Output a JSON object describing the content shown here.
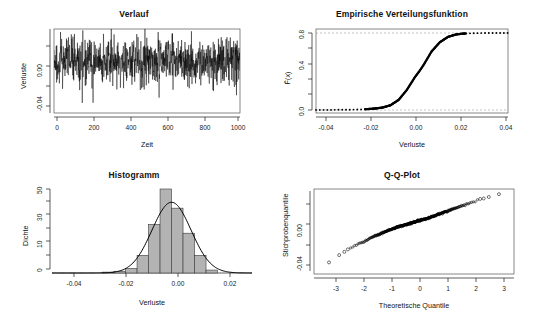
{
  "figure": {
    "background": "#ffffff",
    "layout": "2x2 panel grid",
    "width": 537,
    "height": 322
  },
  "panels": [
    {
      "id": "verlauf",
      "title": "Verlauf",
      "xlabel": "Zeit",
      "ylabel": "Verluste",
      "xticks": [
        "0",
        "200",
        "400",
        "600",
        "800",
        "1000"
      ],
      "yticks": [
        "-0.04",
        "0.00"
      ]
    },
    {
      "id": "ecdf",
      "title": "Empirische Verteilungsfunktion",
      "xlabel": "Verluste",
      "ylabel": "F(x)",
      "xticks": [
        "-0.04",
        "-0.02",
        "0.00",
        "0.02",
        "0.04"
      ],
      "yticks": [
        "0.0",
        "0.4",
        "0.8"
      ]
    },
    {
      "id": "histogram",
      "title": "Histogramm",
      "xlabel": "Verluste",
      "ylabel": "Dichte",
      "xticks": [
        "-0.04",
        "-0.02",
        "0.00",
        "0.02"
      ],
      "yticks": [
        "0",
        "10",
        "30",
        "50"
      ]
    },
    {
      "id": "qq",
      "title": "Q-Q-Plot",
      "xlabel": "Theoretische Quantile",
      "ylabel": "Stichprobenquantile",
      "xticks": [
        "-3",
        "-2",
        "-1",
        "0",
        "1",
        "2",
        "3"
      ],
      "yticks": [
        "-0.04",
        "0.00"
      ]
    }
  ],
  "chart_data": [
    {
      "type": "line",
      "id": "verlauf",
      "title": "Verlauf",
      "xlabel": "Zeit",
      "ylabel": "Verluste",
      "xlim": [
        0,
        1000
      ],
      "ylim": [
        -0.05,
        0.032
      ],
      "xticks": [
        0,
        200,
        400,
        600,
        800,
        1000
      ],
      "yticks": [
        -0.04,
        0.0
      ],
      "grid": false,
      "description": "Time series of 1000 simulated loss returns fluctuating around zero with volatility clustering; several large negative spikes near t=210 and t=565 and positive spikes near t=445 and t=560.",
      "series": [
        {
          "name": "Verluste",
          "n_points": 1000,
          "mean": 0.0,
          "sd": 0.0088,
          "min": -0.046,
          "max": 0.03,
          "notable_spikes": [
            {
              "x": 210,
              "y": -0.04
            },
            {
              "x": 445,
              "y": 0.027
            },
            {
              "x": 560,
              "y": 0.029
            },
            {
              "x": 565,
              "y": -0.035
            },
            {
              "x": 930,
              "y": 0.024
            }
          ]
        }
      ]
    },
    {
      "type": "line",
      "id": "ecdf",
      "title": "Empirische Verteilungsfunktion",
      "xlabel": "Verluste",
      "ylabel": "F(x)",
      "xlim": [
        -0.05,
        0.043
      ],
      "ylim": [
        0.0,
        1.0
      ],
      "xticks": [
        -0.04,
        -0.02,
        0.0,
        0.02,
        0.04
      ],
      "yticks": [
        0.0,
        0.4,
        0.8
      ],
      "grid": true,
      "gridlines": [
        0.0,
        1.0
      ],
      "description": "Empirical cumulative distribution function, a smooth sigmoid rising from 0 to 1, centered at about 0.00, drawn as a dense run of step dots.",
      "x": [
        -0.046,
        -0.04,
        -0.034,
        -0.03,
        -0.026,
        -0.022,
        -0.018,
        -0.014,
        -0.01,
        -0.006,
        -0.002,
        0.0,
        0.002,
        0.006,
        0.01,
        0.014,
        0.018,
        0.022,
        0.026,
        0.03,
        0.034,
        0.04
      ],
      "values": [
        0.001,
        0.002,
        0.004,
        0.006,
        0.01,
        0.017,
        0.03,
        0.06,
        0.13,
        0.26,
        0.43,
        0.5,
        0.58,
        0.76,
        0.88,
        0.95,
        0.982,
        0.993,
        0.997,
        0.999,
        0.9995,
        1.0
      ]
    },
    {
      "type": "bar",
      "id": "histogram",
      "title": "Histogramm",
      "xlabel": "Verluste",
      "ylabel": "Dichte",
      "xlim": [
        -0.052,
        0.035
      ],
      "ylim": [
        0,
        57
      ],
      "xticks": [
        -0.04,
        -0.02,
        0.0,
        0.02
      ],
      "yticks": [
        0,
        10,
        30,
        50
      ],
      "grid": false,
      "bin_width": 0.005,
      "description": "Histogram of losses with overlaid kernel density curve peaking near 48 at x=0.00.",
      "bin_edges": [
        -0.03,
        -0.025,
        -0.02,
        -0.015,
        -0.01,
        -0.005,
        0.0,
        0.005,
        0.01,
        0.015,
        0.02
      ],
      "values": [
        0.6,
        1.2,
        3.0,
        12.0,
        33.0,
        57.0,
        44.0,
        27.0,
        12.0,
        2.0
      ],
      "density_curve": {
        "name": "Dichte",
        "peak_x": 0.0,
        "peak_y": 48.0,
        "sd": 0.0085
      }
    },
    {
      "type": "scatter",
      "id": "qq",
      "title": "Q-Q-Plot",
      "xlabel": "Theoretische Quantile",
      "ylabel": "Stichprobenquantile",
      "xlim": [
        -3.5,
        3.5
      ],
      "ylim": [
        -0.05,
        0.032
      ],
      "xticks": [
        -3,
        -2,
        -1,
        0,
        1,
        2,
        3
      ],
      "yticks": [
        -0.04,
        0.0
      ],
      "grid": false,
      "description": "Normal Q-Q plot of 1000 sample quantiles against theoretical normal quantiles; points follow a nearly straight line with slight heavy-tail deviation at both extremes (open circles).",
      "x": [
        -3.3,
        -2.9,
        -2.6,
        -2.3,
        -2.0,
        -1.5,
        -1.0,
        -0.5,
        0.0,
        0.5,
        1.0,
        1.5,
        2.0,
        2.3,
        2.6,
        2.9,
        3.3
      ],
      "values": [
        -0.046,
        -0.037,
        -0.031,
        -0.026,
        -0.022,
        -0.015,
        -0.009,
        -0.004,
        0.0,
        0.004,
        0.009,
        0.014,
        0.019,
        0.022,
        0.024,
        0.027,
        0.03
      ]
    }
  ]
}
